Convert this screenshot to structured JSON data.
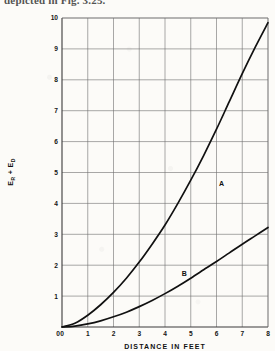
{
  "page": {
    "running_text": "depicted in Fig. 3.25."
  },
  "chart_data": {
    "type": "line",
    "title": "",
    "subtitle": "",
    "xlabel": "DISTANCE IN FEET",
    "ylabel": "Eᴿ + Eᴰ",
    "ylabel_parts": {
      "first": "E",
      "first_sub": "R",
      "operator": "+",
      "second": "E",
      "second_sub": "D"
    },
    "xlim": [
      0,
      8
    ],
    "ylim": [
      0,
      10
    ],
    "grid": true,
    "legend": "inline-labels",
    "xticks": [
      "0",
      "1",
      "2",
      "3",
      "4",
      "5",
      "6",
      "7",
      "8"
    ],
    "yticks": [
      "0",
      "1",
      "2",
      "3",
      "4",
      "5",
      "6",
      "7",
      "8",
      "9",
      "10"
    ],
    "x": [
      0,
      0.5,
      1,
      1.5,
      2,
      2.5,
      3,
      3.5,
      4,
      4.5,
      5,
      5.5,
      6,
      6.5,
      7,
      7.5,
      8
    ],
    "series": [
      {
        "name": "A",
        "label": "A",
        "label_x": 6.1,
        "label_y": 4.55,
        "color": "#111111",
        "values": [
          0,
          0.12,
          0.38,
          0.72,
          1.12,
          1.58,
          2.1,
          2.68,
          3.3,
          4.0,
          4.75,
          5.55,
          6.4,
          7.3,
          8.2,
          9.05,
          9.85
        ]
      },
      {
        "name": "B",
        "label": "B",
        "label_x": 4.65,
        "label_y": 1.65,
        "color": "#111111",
        "values": [
          0,
          0.03,
          0.1,
          0.2,
          0.33,
          0.48,
          0.66,
          0.86,
          1.08,
          1.32,
          1.58,
          1.85,
          2.12,
          2.4,
          2.68,
          2.95,
          3.22
        ]
      }
    ],
    "annotations": []
  }
}
